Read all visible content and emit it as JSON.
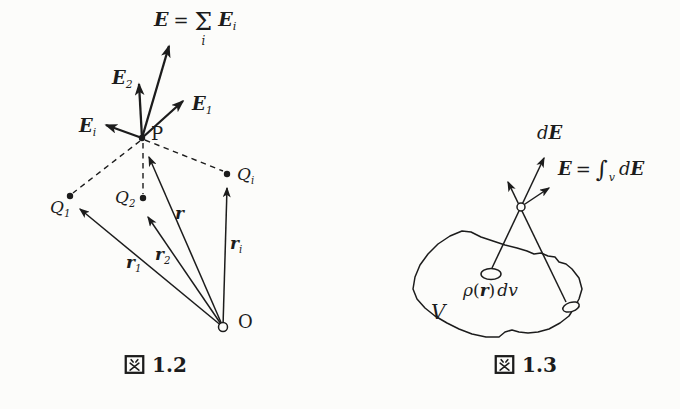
{
  "page": {
    "background": "#fcfcfa",
    "ink": "#1c1c1c"
  },
  "figure_left": {
    "caption": {
      "kanji": "図",
      "number": "1.2"
    },
    "formula_total_field": {
      "lhs": "E",
      "equals": "=",
      "sum": "Σ",
      "sum_sub": "i",
      "rhs_base": "E",
      "rhs_sub": "i"
    },
    "field_vectors": {
      "e2": {
        "base": "E",
        "sub": "2"
      },
      "e1": {
        "base": "E",
        "sub": "1"
      },
      "ei": {
        "base": "E",
        "sub": "i"
      }
    },
    "points": {
      "field_point": "P",
      "origin": "O"
    },
    "charges": {
      "q1": {
        "base": "Q",
        "sub": "1"
      },
      "q2": {
        "base": "Q",
        "sub": "2"
      },
      "qi": {
        "base": "Q",
        "sub": "i"
      }
    },
    "position_vectors": {
      "r": {
        "base": "r",
        "sub": ""
      },
      "r1": {
        "base": "r",
        "sub": "1"
      },
      "r2": {
        "base": "r",
        "sub": "2"
      },
      "ri": {
        "base": "r",
        "sub": "i"
      }
    }
  },
  "figure_right": {
    "caption": {
      "kanji": "図",
      "number": "1.3"
    },
    "labels": {
      "de": {
        "d": "d",
        "e": "E"
      },
      "total": {
        "e": "E",
        "equals": "=",
        "integral": "∫",
        "integral_sub": "v",
        "d": "d",
        "e2": "E"
      },
      "density": {
        "rho": "ρ",
        "open": "(",
        "r": "r",
        "close": ")",
        "dv": "dv"
      },
      "volume": "V"
    }
  }
}
